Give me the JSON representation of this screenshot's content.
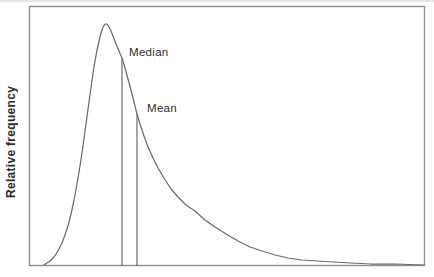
{
  "figure": {
    "kind": "statistics-textbook-figure"
  },
  "chart_data": {
    "type": "line",
    "subtype": "distribution-curve",
    "title": "",
    "xlabel": "",
    "ylabel": "Relative frequency",
    "x_ticks": [],
    "y_ticks": [],
    "grid": false,
    "frame": true,
    "legend": null,
    "annotations": {
      "median": {
        "label": "Median",
        "marker": "vertical-line"
      },
      "mean": {
        "label": "Mean",
        "marker": "vertical-line"
      }
    },
    "plot_box_px": {
      "left": 29,
      "top": 6,
      "right": 425,
      "bottom": 266
    },
    "curve_points_px": [
      [
        44,
        265
      ],
      [
        47,
        263
      ],
      [
        50,
        261
      ],
      [
        53,
        258
      ],
      [
        56,
        254
      ],
      [
        59,
        249
      ],
      [
        62,
        243
      ],
      [
        65,
        235
      ],
      [
        68,
        226
      ],
      [
        71,
        214
      ],
      [
        74,
        200
      ],
      [
        77,
        184
      ],
      [
        80,
        166
      ],
      [
        83,
        146
      ],
      [
        86,
        124
      ],
      [
        89,
        102
      ],
      [
        92,
        80
      ],
      [
        95,
        61
      ],
      [
        97,
        50
      ],
      [
        99,
        41
      ],
      [
        101,
        33
      ],
      [
        103,
        27
      ],
      [
        105,
        24
      ],
      [
        107,
        24
      ],
      [
        109,
        27
      ],
      [
        111,
        31
      ],
      [
        113,
        36
      ],
      [
        116,
        44
      ],
      [
        119,
        51
      ],
      [
        122,
        58
      ],
      [
        125,
        68
      ],
      [
        128,
        79
      ],
      [
        131,
        90
      ],
      [
        134,
        102
      ],
      [
        137,
        114
      ],
      [
        140,
        124
      ],
      [
        144,
        136
      ],
      [
        148,
        147
      ],
      [
        153,
        158
      ],
      [
        158,
        168
      ],
      [
        164,
        178
      ],
      [
        171,
        189
      ],
      [
        178,
        197
      ],
      [
        186,
        205
      ],
      [
        195,
        211
      ],
      [
        205,
        220
      ],
      [
        215,
        227
      ],
      [
        226,
        234
      ],
      [
        238,
        241
      ],
      [
        250,
        247
      ],
      [
        262,
        251
      ],
      [
        275,
        255
      ],
      [
        288,
        258
      ],
      [
        302,
        260
      ],
      [
        317,
        261
      ],
      [
        333,
        262
      ],
      [
        351,
        263
      ],
      [
        371,
        264
      ],
      [
        395,
        264
      ],
      [
        424,
        265
      ]
    ],
    "median_line_px": {
      "x": 122,
      "y_top": 58,
      "y_bottom": 266
    },
    "mean_line_px": {
      "x": 137,
      "y_top": 114,
      "y_bottom": 266
    },
    "colors": {
      "curve": "#6b6b6b",
      "frame": "#8f8f8f",
      "reference_lines": "#6b6b6b",
      "text": "#2d2d2d",
      "background": "#ffffff"
    }
  }
}
